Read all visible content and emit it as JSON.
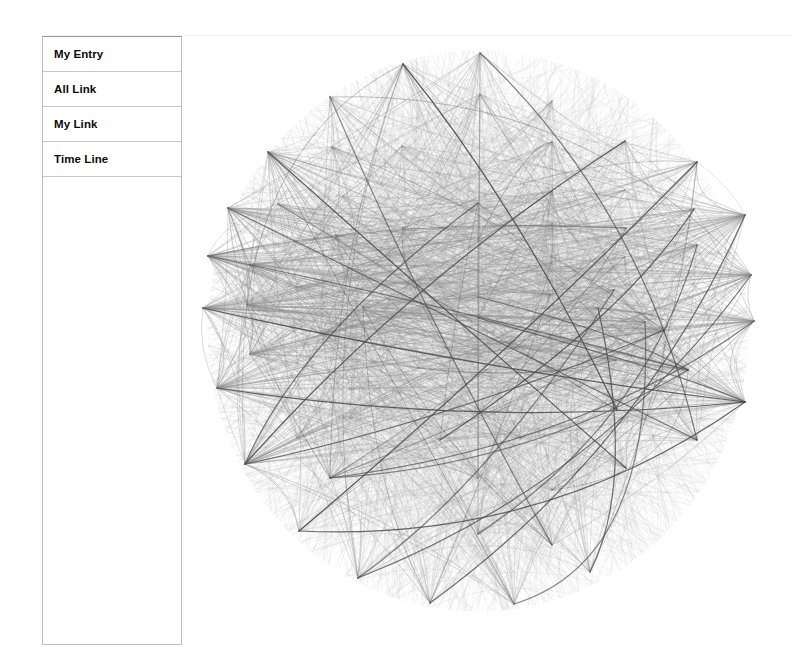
{
  "app": {
    "background": "#ffffff",
    "panel_border": "#bdbdbd"
  },
  "sidebar": {
    "items": [
      {
        "label": "My Entry",
        "name": "my-entry"
      },
      {
        "label": "All Link",
        "name": "all-link"
      },
      {
        "label": "My Link",
        "name": "my-link"
      },
      {
        "label": "Time Line",
        "name": "time-line"
      }
    ]
  },
  "graph": {
    "title": "",
    "node_count": 72,
    "node_fill": "#ffffff",
    "node_stroke": "#1a1a1a",
    "node_size": 10,
    "edge_color_light": "#b4b4b4",
    "edge_color_mid": "#8f8f8f",
    "edge_color_dark": "#4a4a4a",
    "layout": "circular-blob",
    "center": [
      478,
      331
    ],
    "radius": [
      270,
      280
    ],
    "nodes": [
      {
        "id": 0,
        "x": 480,
        "y": 53
      },
      {
        "id": 1,
        "x": 403,
        "y": 64
      },
      {
        "id": 2,
        "x": 330,
        "y": 97
      },
      {
        "id": 3,
        "x": 480,
        "y": 94
      },
      {
        "id": 4,
        "x": 552,
        "y": 101
      },
      {
        "id": 5,
        "x": 268,
        "y": 152
      },
      {
        "id": 6,
        "x": 332,
        "y": 147
      },
      {
        "id": 7,
        "x": 402,
        "y": 146
      },
      {
        "id": 8,
        "x": 552,
        "y": 142
      },
      {
        "id": 9,
        "x": 625,
        "y": 141
      },
      {
        "id": 10,
        "x": 228,
        "y": 208
      },
      {
        "id": 11,
        "x": 278,
        "y": 204
      },
      {
        "id": 12,
        "x": 343,
        "y": 196
      },
      {
        "id": 13,
        "x": 478,
        "y": 203
      },
      {
        "id": 14,
        "x": 552,
        "y": 191
      },
      {
        "id": 15,
        "x": 625,
        "y": 190
      },
      {
        "id": 16,
        "x": 697,
        "y": 162
      },
      {
        "id": 17,
        "x": 336,
        "y": 235
      },
      {
        "id": 18,
        "x": 403,
        "y": 228
      },
      {
        "id": 19,
        "x": 478,
        "y": 240
      },
      {
        "id": 20,
        "x": 552,
        "y": 224
      },
      {
        "id": 21,
        "x": 626,
        "y": 228
      },
      {
        "id": 22,
        "x": 694,
        "y": 209
      },
      {
        "id": 23,
        "x": 745,
        "y": 215
      },
      {
        "id": 24,
        "x": 208,
        "y": 256
      },
      {
        "id": 25,
        "x": 250,
        "y": 265
      },
      {
        "id": 26,
        "x": 348,
        "y": 268
      },
      {
        "id": 27,
        "x": 478,
        "y": 270
      },
      {
        "id": 28,
        "x": 552,
        "y": 263
      },
      {
        "id": 29,
        "x": 625,
        "y": 257
      },
      {
        "id": 30,
        "x": 697,
        "y": 245
      },
      {
        "id": 31,
        "x": 296,
        "y": 287
      },
      {
        "id": 32,
        "x": 408,
        "y": 284
      },
      {
        "id": 33,
        "x": 478,
        "y": 297
      },
      {
        "id": 34,
        "x": 550,
        "y": 295
      },
      {
        "id": 35,
        "x": 614,
        "y": 290
      },
      {
        "id": 36,
        "x": 751,
        "y": 275
      },
      {
        "id": 37,
        "x": 203,
        "y": 308
      },
      {
        "id": 38,
        "x": 247,
        "y": 305
      },
      {
        "id": 39,
        "x": 363,
        "y": 307
      },
      {
        "id": 40,
        "x": 478,
        "y": 318
      },
      {
        "id": 41,
        "x": 548,
        "y": 294
      },
      {
        "id": 42,
        "x": 645,
        "y": 322
      },
      {
        "id": 43,
        "x": 754,
        "y": 321
      },
      {
        "id": 44,
        "x": 322,
        "y": 334
      },
      {
        "id": 45,
        "x": 478,
        "y": 350
      },
      {
        "id": 46,
        "x": 598,
        "y": 308
      },
      {
        "id": 47,
        "x": 664,
        "y": 330
      },
      {
        "id": 48,
        "x": 250,
        "y": 354
      },
      {
        "id": 49,
        "x": 446,
        "y": 348
      },
      {
        "id": 50,
        "x": 520,
        "y": 347
      },
      {
        "id": 51,
        "x": 616,
        "y": 360
      },
      {
        "id": 52,
        "x": 217,
        "y": 388
      },
      {
        "id": 53,
        "x": 418,
        "y": 368
      },
      {
        "id": 54,
        "x": 552,
        "y": 372
      },
      {
        "id": 55,
        "x": 688,
        "y": 370
      },
      {
        "id": 56,
        "x": 350,
        "y": 389
      },
      {
        "id": 57,
        "x": 580,
        "y": 387
      },
      {
        "id": 58,
        "x": 745,
        "y": 402
      },
      {
        "id": 59,
        "x": 350,
        "y": 418
      },
      {
        "id": 60,
        "x": 478,
        "y": 414
      },
      {
        "id": 61,
        "x": 617,
        "y": 410
      },
      {
        "id": 62,
        "x": 245,
        "y": 464
      },
      {
        "id": 63,
        "x": 297,
        "y": 438
      },
      {
        "id": 64,
        "x": 440,
        "y": 440
      },
      {
        "id": 65,
        "x": 521,
        "y": 438
      },
      {
        "id": 66,
        "x": 697,
        "y": 440
      },
      {
        "id": 67,
        "x": 330,
        "y": 478
      },
      {
        "id": 68,
        "x": 478,
        "y": 478
      },
      {
        "id": 69,
        "x": 552,
        "y": 490
      },
      {
        "id": 70,
        "x": 626,
        "y": 468
      },
      {
        "id": 71,
        "x": 299,
        "y": 531
      },
      {
        "id": 72,
        "x": 478,
        "y": 534
      },
      {
        "id": 73,
        "x": 552,
        "y": 545
      },
      {
        "id": 74,
        "x": 358,
        "y": 578
      },
      {
        "id": 75,
        "x": 430,
        "y": 603
      },
      {
        "id": 76,
        "x": 514,
        "y": 604
      },
      {
        "id": 77,
        "x": 590,
        "y": 572
      }
    ]
  }
}
